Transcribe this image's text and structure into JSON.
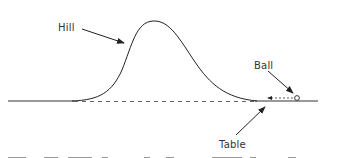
{
  "diagram": {
    "labels": {
      "hill": "Hill",
      "ball": "Ball",
      "table": "Table"
    },
    "colors": {
      "stroke": "#222222",
      "text": "#333333"
    }
  }
}
